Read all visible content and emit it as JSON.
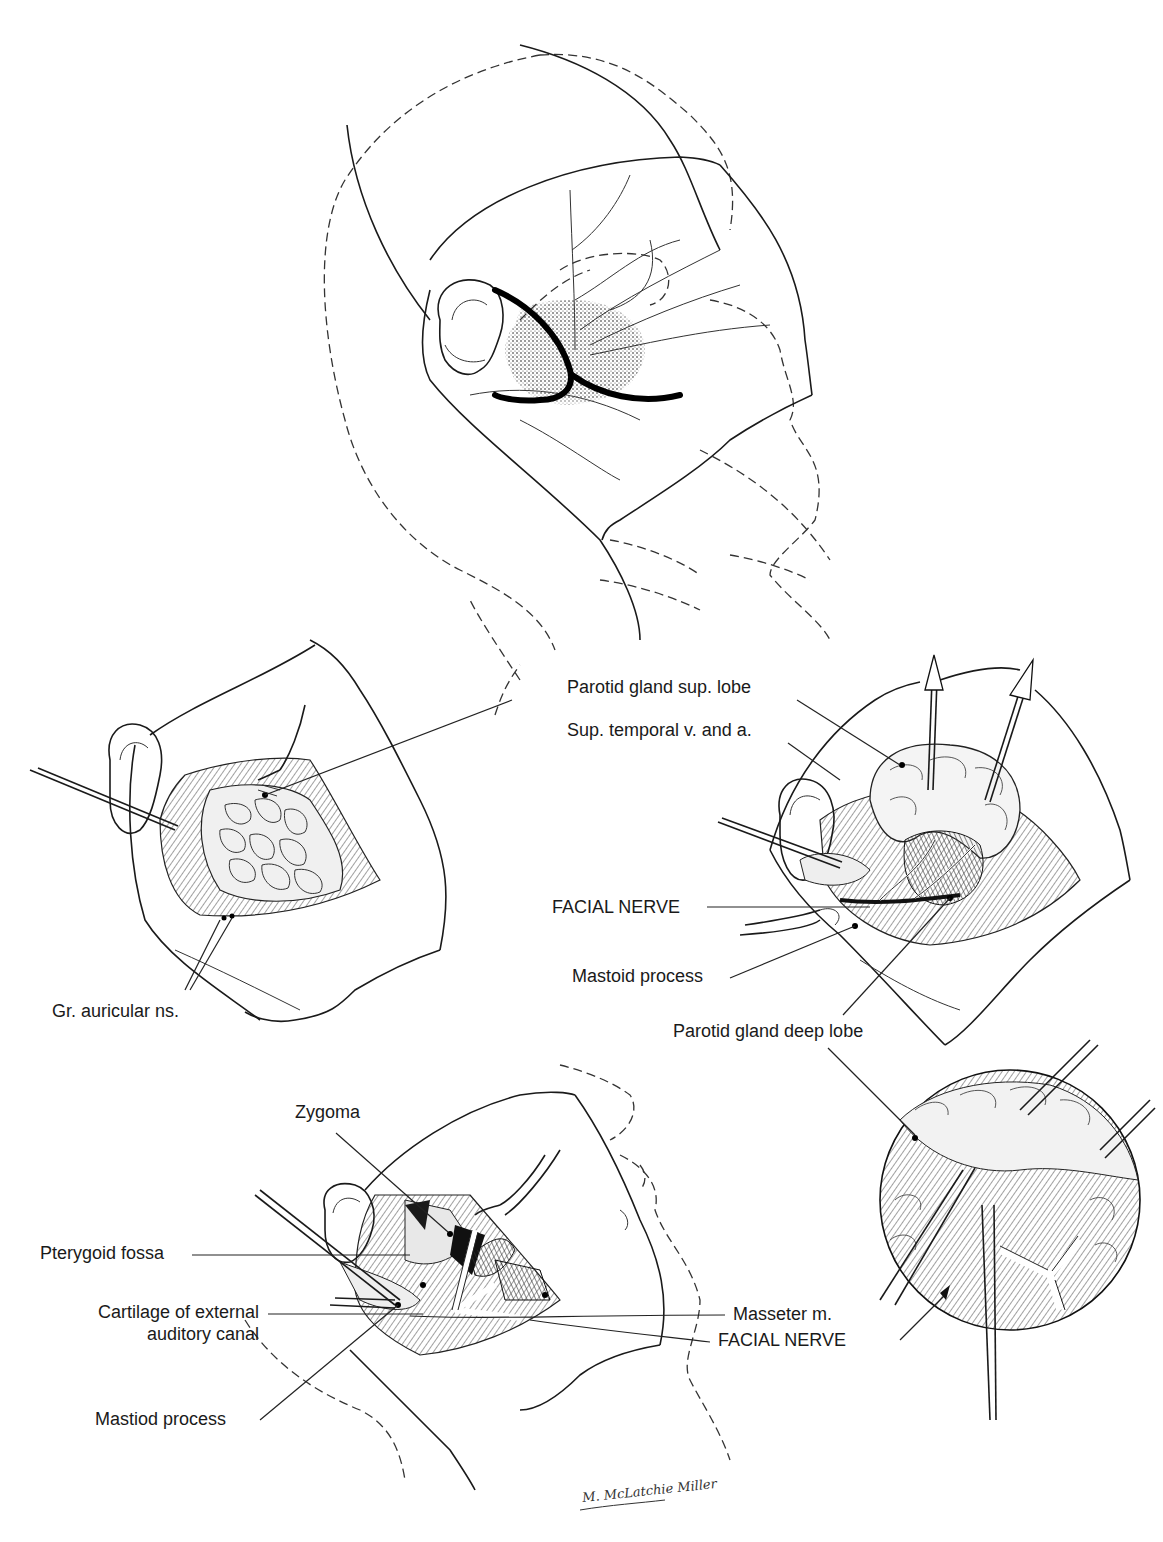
{
  "figure": {
    "panels": [
      {
        "id": "top",
        "name": "incision-planning-head-view"
      },
      {
        "id": "middle-left",
        "name": "parotid-exposure"
      },
      {
        "id": "middle-right",
        "name": "superficial-lobe-retraction"
      },
      {
        "id": "lower-left",
        "name": "deep-dissection"
      },
      {
        "id": "lower-right",
        "name": "deep-lobe-inset-circle"
      }
    ]
  },
  "labels": {
    "parotid_sup_lobe": "Parotid gland sup. lobe",
    "sup_temporal": "Sup. temporal v. and a.",
    "facial_nerve_1": "FACIAL NERVE",
    "mastoid_process_1": "Mastoid process",
    "parotid_deep_lobe": "Parotid gland deep lobe",
    "gr_auricular": "Gr. auricular ns.",
    "zygoma": "Zygoma",
    "pterygoid_fossa": "Pterygoid fossa",
    "cartilage_line1": "Cartilage of external",
    "cartilage_line2": "auditory canal",
    "masseter": "Masseter m.",
    "facial_nerve_2": "FACIAL NERVE",
    "mastoid_process_2": "Mastiod process"
  },
  "signature": "M. McLatchie Miller"
}
